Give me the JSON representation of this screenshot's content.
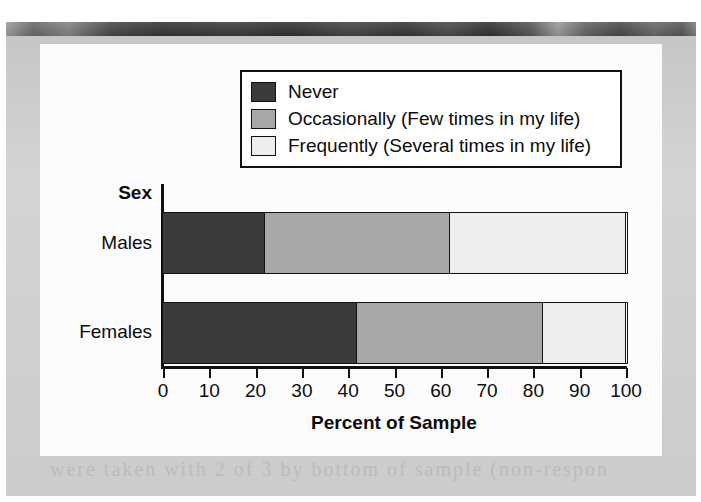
{
  "figure": {
    "background_color": "#cfcfcf",
    "canvas_color": "#fcfcfc",
    "ghost_text": "were taken with 2 of 3 by bottom of sample (non-response)"
  },
  "legend": {
    "position": "top-center",
    "items": [
      {
        "label": "Never",
        "color": "#3a3a3a"
      },
      {
        "label": "Occasionally (Few times in my life)",
        "color": "#a8a8a8"
      },
      {
        "label": "Frequently (Several times in my life)",
        "color": "#eeeeee"
      }
    ]
  },
  "chart_data": {
    "type": "bar",
    "orientation": "horizontal",
    "stacked": true,
    "title": "",
    "xlabel": "Percent of Sample",
    "ylabel": "Sex",
    "xlim": [
      0,
      100
    ],
    "grid": false,
    "legend_position": "top-center",
    "xticks": [
      0,
      10,
      20,
      30,
      40,
      50,
      60,
      70,
      80,
      90,
      100
    ],
    "xtick_labels": [
      "0",
      "10",
      "20",
      "30",
      "40",
      "50",
      "60",
      "70",
      "80",
      "90",
      "100"
    ],
    "categories": [
      "Males",
      "Females"
    ],
    "series": [
      {
        "name": "Never",
        "color": "#3a3a3a",
        "values": [
          22,
          42
        ]
      },
      {
        "name": "Occasionally (Few times in my life)",
        "color": "#a8a8a8",
        "values": [
          40,
          40
        ]
      },
      {
        "name": "Frequently (Several times in my life)",
        "color": "#eeeeee",
        "values": [
          38,
          18
        ]
      }
    ],
    "cumulative_boundaries": {
      "Males": [
        22,
        62,
        100
      ],
      "Females": [
        42,
        82,
        100
      ]
    }
  }
}
